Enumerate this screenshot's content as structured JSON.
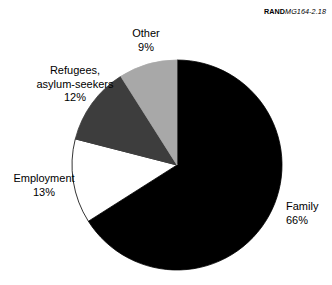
{
  "figure": {
    "credit_brand": "RAND",
    "credit_id": "MG164-2.18",
    "background_color": "#ffffff"
  },
  "chart_data": {
    "type": "pie",
    "title": "",
    "subtitle": "",
    "xlabel": "",
    "ylabel": "",
    "legend_position": "none",
    "grid": false,
    "labels_inline": true,
    "total_percent": 100,
    "categories": [
      "Family",
      "Employment",
      "Refugees, asylum-seekers",
      "Other"
    ],
    "values": [
      66,
      13,
      12,
      9
    ],
    "value_unit": "%",
    "start_angle_deg": 0,
    "direction": "clockwise",
    "slices": [
      {
        "name": "Family",
        "label_line1": "Family",
        "label_line2": "66%",
        "value": 66,
        "color": "#000000",
        "stroke": "#000000"
      },
      {
        "name": "Employment",
        "label_line1": "Employment",
        "label_line2": "13%",
        "value": 13,
        "color": "#ffffff",
        "stroke": "#000000"
      },
      {
        "name": "Refugees, asylum-seekers",
        "label_line1": "Refugees,",
        "label_line2": "asylum-seekers",
        "label_line3": "12%",
        "value": 12,
        "color": "#3d3d3d",
        "stroke": "#3d3d3d"
      },
      {
        "name": "Other",
        "label_line1": "Other",
        "label_line2": "9%",
        "value": 9,
        "color": "#a8a8a8",
        "stroke": "#a8a8a8"
      }
    ]
  }
}
